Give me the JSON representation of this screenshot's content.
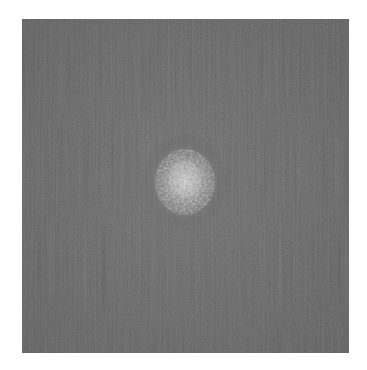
{
  "image": {
    "description": "Grayscale square with noisy dark background and a bright speckled blob near the center",
    "background_color": "#ffffff",
    "panel": {
      "x": 22,
      "y": 19,
      "width": 327,
      "height": 334,
      "base_color": "#4a4a4a"
    },
    "blob": {
      "center_x": 163,
      "center_y": 163,
      "radius": 30,
      "core_color": "#d8d8d8"
    }
  }
}
